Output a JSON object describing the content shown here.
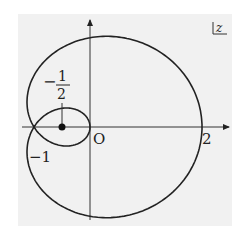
{
  "diagram": {
    "plane_label": "z",
    "origin_label": "O",
    "labels": {
      "x_two": "2",
      "neg_one": "−1",
      "frac_num": "1",
      "frac_den": "2",
      "frac_sign": "−"
    },
    "curve": {
      "type": "limacon",
      "equation": "r = 1 + 2cosθ",
      "pole": [
        -1,
        0
      ]
    },
    "marked_point": {
      "x": -0.5,
      "y": 0,
      "label": "−1/2"
    },
    "colors": {
      "background": "#f1f1f1",
      "stroke": "#222222"
    }
  }
}
